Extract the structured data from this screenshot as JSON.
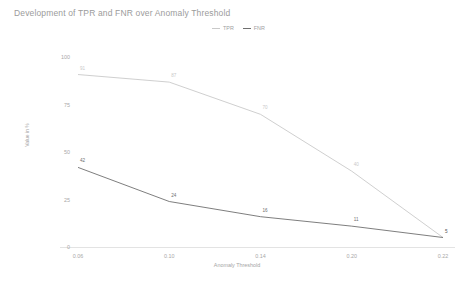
{
  "chart_data": {
    "type": "line",
    "title": "Development of TPR and FNR over Anomaly Threshold",
    "xlabel": "Anomaly Threshold",
    "ylabel": "Value in %",
    "x": [
      0.06,
      0.1,
      0.14,
      0.2,
      0.22
    ],
    "xtick_labels": [
      "0.06",
      "0.10",
      "0.14",
      "0.20",
      "0.22"
    ],
    "ytick_labels": [
      "0",
      "25",
      "50",
      "75",
      "100"
    ],
    "ylim": [
      0,
      105
    ],
    "yticks": [
      0,
      25,
      50,
      75,
      100
    ],
    "grid": false,
    "legend_position": "top-center",
    "series": [
      {
        "name": "TPR",
        "color": "#c9c9c9",
        "values": [
          91,
          87,
          70,
          40,
          5
        ],
        "labels": [
          "91",
          "87",
          "70",
          "40",
          "5"
        ]
      },
      {
        "name": "FNR",
        "color": "#6f6f6f",
        "values": [
          42,
          24,
          16,
          11,
          5
        ],
        "labels": [
          "42",
          "24",
          "16",
          "11",
          "5"
        ]
      }
    ]
  },
  "legend": {
    "items": [
      {
        "label": "TPR",
        "color": "#c9c9c9"
      },
      {
        "label": "FNR",
        "color": "#6f6f6f"
      }
    ]
  },
  "axis": {
    "x_title": "Anomaly Threshold",
    "y_title": "Value in %"
  }
}
